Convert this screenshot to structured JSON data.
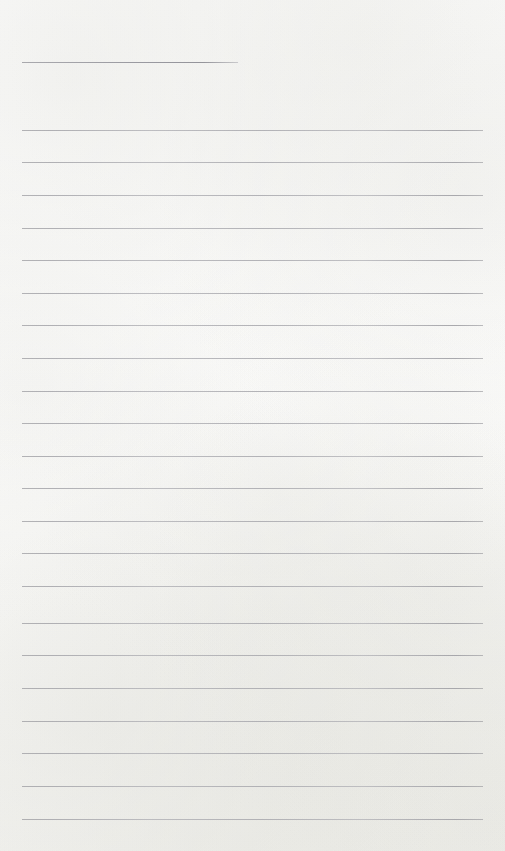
{
  "document": {
    "kind": "lined-paper-scan",
    "title": "Blank Ruled Notebook Page",
    "page_width": 505,
    "page_height": 851,
    "paper_color": "#fdfdfc",
    "rule_color": "#b0b0b5",
    "written_content": "",
    "header_note": ""
  },
  "rules": [
    {
      "id": "header-rule",
      "y": 62,
      "x": 22,
      "width": 216,
      "role": "header"
    },
    {
      "id": "rule-1",
      "y": 130,
      "x": 22,
      "width": 461,
      "role": "body"
    },
    {
      "id": "rule-2",
      "y": 162,
      "x": 22,
      "width": 461,
      "role": "body"
    },
    {
      "id": "rule-3",
      "y": 195,
      "x": 22,
      "width": 461,
      "role": "body"
    },
    {
      "id": "rule-4",
      "y": 228,
      "x": 22,
      "width": 461,
      "role": "body"
    },
    {
      "id": "rule-5",
      "y": 260,
      "x": 22,
      "width": 461,
      "role": "body"
    },
    {
      "id": "rule-6",
      "y": 293,
      "x": 22,
      "width": 461,
      "role": "body"
    },
    {
      "id": "rule-7",
      "y": 325,
      "x": 22,
      "width": 461,
      "role": "body"
    },
    {
      "id": "rule-8",
      "y": 358,
      "x": 22,
      "width": 461,
      "role": "body"
    },
    {
      "id": "rule-9",
      "y": 391,
      "x": 22,
      "width": 461,
      "role": "body"
    },
    {
      "id": "rule-10",
      "y": 423,
      "x": 22,
      "width": 461,
      "role": "body"
    },
    {
      "id": "rule-11",
      "y": 456,
      "x": 22,
      "width": 461,
      "role": "body"
    },
    {
      "id": "rule-12",
      "y": 488,
      "x": 22,
      "width": 461,
      "role": "body"
    },
    {
      "id": "rule-13",
      "y": 521,
      "x": 22,
      "width": 461,
      "role": "body"
    },
    {
      "id": "rule-14",
      "y": 553,
      "x": 22,
      "width": 461,
      "role": "body"
    },
    {
      "id": "rule-15",
      "y": 586,
      "x": 22,
      "width": 461,
      "role": "body"
    },
    {
      "id": "rule-16",
      "y": 623,
      "x": 22,
      "width": 461,
      "role": "body"
    },
    {
      "id": "rule-17",
      "y": 655,
      "x": 22,
      "width": 461,
      "role": "body"
    },
    {
      "id": "rule-18",
      "y": 688,
      "x": 22,
      "width": 461,
      "role": "body"
    },
    {
      "id": "rule-19",
      "y": 721,
      "x": 22,
      "width": 461,
      "role": "body"
    },
    {
      "id": "rule-20",
      "y": 753,
      "x": 22,
      "width": 461,
      "role": "body"
    },
    {
      "id": "rule-21",
      "y": 786,
      "x": 22,
      "width": 461,
      "role": "body"
    },
    {
      "id": "rule-22",
      "y": 819,
      "x": 22,
      "width": 461,
      "role": "body"
    }
  ]
}
